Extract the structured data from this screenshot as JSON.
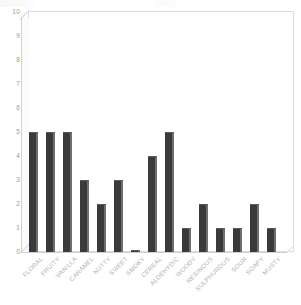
{
  "chart_data": {
    "type": "bar",
    "title": "",
    "subtitle": "",
    "xlabel": "",
    "ylabel": "",
    "ylim": [
      0,
      10
    ],
    "yticks": [
      10,
      9,
      8,
      7,
      6,
      5,
      4,
      3,
      2,
      1,
      0
    ],
    "grid": false,
    "legend": null,
    "orientation": "vertical",
    "style": "3d-columns",
    "bar_color": "#3a3a3a",
    "bar_side_color": "#6e6e6e",
    "frame_color": "#dcdcdc",
    "tick_label_color": "#9a9a9a",
    "category_label_color": "#b0b0b0",
    "category_label_rotation": -45,
    "categories": [
      "FLORAL",
      "FRUITY",
      "VANILLA",
      "CARAMEL",
      "NUTTY",
      "SWEET",
      "SMOKY",
      "CEREAL",
      "ALDEHYDIC",
      "WOODY",
      "RESINOUS",
      "SULPHUROUS",
      "SOUR",
      "SOAPY",
      "MUSTY"
    ],
    "values": [
      5,
      5,
      5,
      3,
      2,
      3,
      0.1,
      4,
      5,
      1,
      2,
      1,
      1,
      2,
      1
    ]
  }
}
